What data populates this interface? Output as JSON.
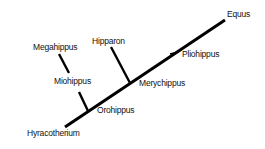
{
  "diagram": {
    "type": "phylogenetic-tree",
    "line_color": "#000000",
    "taxa": [
      {
        "name": "Equus",
        "x": 227,
        "y": 9
      },
      {
        "name": "Pliohippus",
        "x": 182,
        "y": 49
      },
      {
        "name": "Hipparon",
        "x": 92,
        "y": 36
      },
      {
        "name": "Merychippus",
        "x": 139,
        "y": 78
      },
      {
        "name": "Megahippus",
        "x": 33,
        "y": 42
      },
      {
        "name": "Miohippus",
        "x": 54,
        "y": 76
      },
      {
        "name": "Orohippus",
        "x": 97,
        "y": 105
      },
      {
        "name": "Hyracotherium",
        "x": 27,
        "y": 128
      }
    ]
  }
}
